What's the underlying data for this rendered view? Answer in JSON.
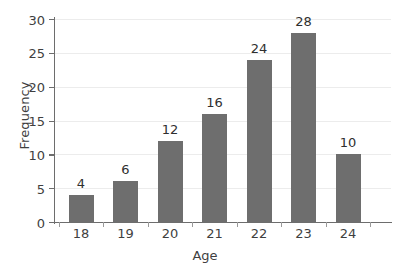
{
  "chart_data": {
    "type": "bar",
    "title": "",
    "xlabel": "Age",
    "ylabel": "Frequency",
    "categories": [
      "18",
      "19",
      "20",
      "21",
      "22",
      "23",
      "24"
    ],
    "values": [
      4,
      6,
      12,
      16,
      24,
      28,
      10
    ],
    "value_labels": [
      "4",
      "6",
      "12",
      "16",
      "24",
      "28",
      "10"
    ],
    "ylim": [
      0,
      30
    ],
    "yticks": [
      0,
      5,
      10,
      15,
      20,
      25,
      30
    ],
    "ytick_labels": [
      "0",
      "5",
      "10",
      "15",
      "20",
      "25",
      "30"
    ],
    "grid": "horizontal",
    "legend": "none",
    "bar_color": "#6e6e6e",
    "gridline_color": "#ececec",
    "axis_color": "#6d6d6d",
    "background_color": "#ffffff",
    "text_color": "#3f3f3f"
  }
}
